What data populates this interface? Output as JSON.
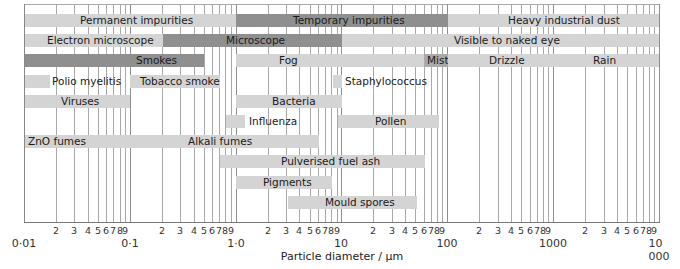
{
  "chart_data": {
    "type": "bar",
    "subtype": "range-bar (log scale)",
    "title": "",
    "xlabel": "Particle diameter / µm",
    "ylabel": "",
    "xscale": "log",
    "xlim": [
      0.01,
      10000
    ],
    "grid": true,
    "decade_ticks": [
      "0·01",
      "0·1",
      "1·0",
      "10",
      "100",
      "1000",
      "10 000"
    ],
    "minor_tick_labels": [
      "2",
      "3",
      "4",
      "5",
      "6",
      "7",
      "8",
      "9"
    ],
    "ranges": [
      {
        "label": "Permanent impurities",
        "row": 0,
        "from": 0.01,
        "to": 1.0,
        "shade": "light"
      },
      {
        "label": "Temporary impurities",
        "row": 0,
        "from": 1.0,
        "to": 100,
        "shade": "dark"
      },
      {
        "label": "Heavy industrial dust",
        "row": 0,
        "from": 100,
        "to": 10000,
        "shade": "light"
      },
      {
        "label": "Electron microscope",
        "row": 1,
        "from": 0.01,
        "to": 0.2,
        "shade": "light"
      },
      {
        "label": "Microscope",
        "row": 1,
        "from": 0.2,
        "to": 10,
        "shade": "dark"
      },
      {
        "label": "Visible to naked eye",
        "row": 1,
        "from": 10,
        "to": 10000,
        "shade": "light"
      },
      {
        "label": "Smokes",
        "row": 2,
        "from": 0.01,
        "to": 0.6,
        "shade": "dark"
      },
      {
        "label": "Fog",
        "row": 2,
        "from": 1.0,
        "to": 60,
        "shade": "light"
      },
      {
        "label": "Mist",
        "row": 2,
        "from": 60,
        "to": 100,
        "shade": "mid"
      },
      {
        "label": "Drizzle",
        "row": 2,
        "from": 100,
        "to": 1000,
        "shade": "light"
      },
      {
        "label": "Rain",
        "row": 2,
        "from": 1000,
        "to": 10000,
        "shade": "light"
      },
      {
        "label": "Polio myelitis",
        "row": 3,
        "from": 0.01,
        "to": 0.018,
        "shade": "light"
      },
      {
        "label": "Tobacco smoke",
        "row": 3,
        "from": 0.1,
        "to": 0.7,
        "shade": "light"
      },
      {
        "label": "Staphylococcus",
        "row": 3,
        "from": 8,
        "to": 10,
        "shade": "light"
      },
      {
        "label": "Viruses",
        "row": 4,
        "from": 0.01,
        "to": 0.1,
        "shade": "light"
      },
      {
        "label": "Bacteria",
        "row": 4,
        "from": 1.0,
        "to": 10,
        "shade": "light"
      },
      {
        "label": "Influenza",
        "row": 5,
        "from": 0.8,
        "to": 1.2,
        "shade": "light"
      },
      {
        "label": "Pollen",
        "row": 5,
        "from": 9,
        "to": 85,
        "shade": "light"
      },
      {
        "label": "ZnO fumes / Alkali fumes",
        "row": 6,
        "from": 0.01,
        "to": 6,
        "shade": "light"
      },
      {
        "label": "Pulverised fuel ash",
        "row": 7,
        "from": 0.7,
        "to": 60,
        "shade": "light"
      },
      {
        "label": "Pigments",
        "row": 8,
        "from": 1.0,
        "to": 8,
        "shade": "light"
      },
      {
        "label": "Mould spores",
        "row": 9,
        "from": 3,
        "to": 50,
        "shade": "light"
      }
    ]
  },
  "bars": [
    {
      "text": "Permanent impurities",
      "x": 24,
      "w": 212,
      "row": 0,
      "shade": "",
      "lx": 80
    },
    {
      "text": "Temporary impurities",
      "x": 236,
      "w": 212,
      "row": 0,
      "shade": "dark",
      "lx": 293
    },
    {
      "text": "Heavy industrial dust",
      "x": 448,
      "w": 211,
      "row": 0,
      "shade": "",
      "lx": 508
    },
    {
      "text": "Electron microscope",
      "x": 24,
      "w": 139,
      "row": 1,
      "shade": "",
      "lx": 47
    },
    {
      "text": "Microscope",
      "x": 163,
      "w": 179,
      "row": 1,
      "shade": "dark",
      "lx": 226
    },
    {
      "text": "Visible to naked eye",
      "x": 342,
      "w": 317,
      "row": 1,
      "shade": "",
      "lx": 454
    },
    {
      "text": "Smokes",
      "x": 24,
      "w": 180,
      "row": 2,
      "shade": "dark",
      "lx": 136
    },
    {
      "text": "Fog",
      "x": 236,
      "w": 188,
      "row": 2,
      "shade": "",
      "lx": 279
    },
    {
      "text": "Mist",
      "x": 424,
      "w": 24,
      "row": 2,
      "shade": "mid",
      "lx": 427
    },
    {
      "text": "Drizzle",
      "x": 448,
      "w": 106,
      "row": 2,
      "shade": "",
      "lx": 489
    },
    {
      "text": "Rain",
      "x": 554,
      "w": 105,
      "row": 2,
      "shade": "",
      "lx": 593
    },
    {
      "text": "",
      "x": 24,
      "w": 26,
      "row": 3,
      "shade": "",
      "lx": 0
    },
    {
      "text": "",
      "x": 130,
      "w": 90,
      "row": 3,
      "shade": "",
      "lx": 0
    },
    {
      "text": "",
      "x": 333,
      "w": 9,
      "row": 3,
      "shade": "",
      "lx": 0
    },
    {
      "text": "Viruses",
      "x": 24,
      "w": 106,
      "row": 4,
      "shade": "",
      "lx": 61
    },
    {
      "text": "Bacteria",
      "x": 236,
      "w": 106,
      "row": 4,
      "shade": "",
      "lx": 272
    },
    {
      "text": "",
      "x": 226,
      "w": 19,
      "row": 5,
      "shade": "",
      "lx": 0
    },
    {
      "text": "Pollen",
      "x": 338,
      "w": 101,
      "row": 5,
      "shade": "",
      "lx": 375
    },
    {
      "text": "",
      "x": 24,
      "w": 295,
      "row": 6,
      "shade": "",
      "lx": 0
    },
    {
      "text": "Pulverised fuel ash",
      "x": 220,
      "w": 205,
      "row": 7,
      "shade": "",
      "lx": 281
    },
    {
      "text": "Pigments",
      "x": 236,
      "w": 96,
      "row": 8,
      "shade": "",
      "lx": 263
    },
    {
      "text": "Mould spores",
      "x": 288,
      "w": 129,
      "row": 9,
      "shade": "",
      "lx": 325
    }
  ],
  "outside_labels": [
    {
      "text": "Polio myelitis",
      "x": 52,
      "row": 3
    },
    {
      "text": "Tobacco smoke",
      "x": 140,
      "row": 3
    },
    {
      "text": "Staphylococcus",
      "x": 345,
      "row": 3
    },
    {
      "text": "Influenza",
      "x": 249,
      "row": 5
    },
    {
      "text": "ZnO fumes",
      "x": 28,
      "row": 6
    },
    {
      "text": "Alkali fumes",
      "x": 188,
      "row": 6
    }
  ],
  "axis": {
    "title": "Particle diameter / µm",
    "decades": [
      "0·01",
      "0·1",
      "1·0",
      "10",
      "100",
      "1000",
      "10 000"
    ],
    "minor": [
      "2",
      "3",
      "4",
      "5",
      "6",
      "7",
      "8",
      "9"
    ]
  }
}
